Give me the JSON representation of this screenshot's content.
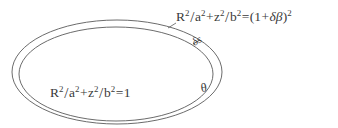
{
  "figure": {
    "background_color": "#ffffff",
    "stroke_color": "#555555",
    "text_color": "#3a3a3a",
    "width": 338,
    "height": 128
  },
  "labels": {
    "outer_equation": {
      "name": "outer-surface-equation",
      "parts": {
        "R": "R",
        "R_exp": "2",
        "slash1": "/",
        "a": "a",
        "a_exp": "2",
        "plus": "+",
        "z": "z",
        "z_exp": "2",
        "slash2": "/",
        "b": "b",
        "b_exp": "2",
        "equals": "=",
        "open_paren": "(",
        "one": "1",
        "plus2": "+",
        "delta": "δ",
        "beta": "β",
        "close_paren": ")",
        "outer_exp": "2"
      },
      "plain_text": "R^2/a^2+z^2/b^2=(1+δβ)^2"
    },
    "inner_equation": {
      "name": "inner-surface-equation",
      "parts": {
        "R": "R",
        "R_exp": "2",
        "slash1": "/",
        "a": "a",
        "a_exp": "2",
        "plus": "+",
        "z": "z",
        "z_exp": "2",
        "slash2": "/",
        "b": "b",
        "b_exp": "2",
        "equals": "=",
        "one": "1"
      },
      "plain_text": "R^2/a^2+z^2/b^2=1"
    },
    "delta_s": {
      "name": "delta-s-annotation",
      "text": "δs"
    },
    "theta": {
      "name": "theta-angle-annotation",
      "text": "θ"
    }
  },
  "geometry": {
    "outer_ellipse": {
      "cx": 117,
      "cy": 72,
      "rx": 105,
      "ry": 52
    },
    "inner_ellipse": {
      "cx": 116,
      "cy": 74,
      "rx": 97,
      "ry": 47
    },
    "stroke_width": 0.9
  }
}
